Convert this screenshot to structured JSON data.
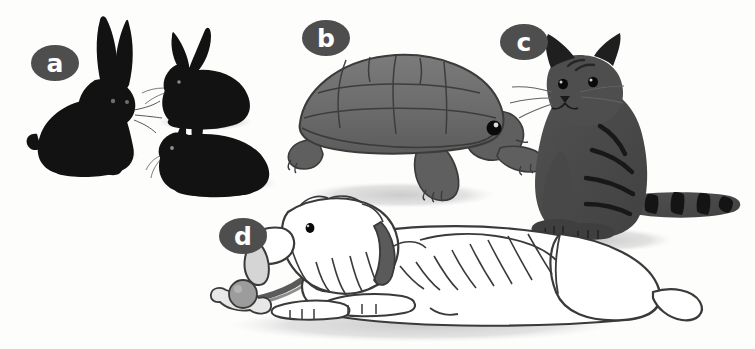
{
  "figure": {
    "background_color": "#fdfdfc",
    "width": 755,
    "height": 349
  },
  "palette": {
    "badge_fill": "#4e4e4e",
    "badge_text": "#ffffff",
    "rabbit_black": "#121212",
    "tortoise_shell": "#6e6e6e",
    "tortoise_shell_dark": "#5a5a5a",
    "tortoise_skin": "#5f5f5f",
    "cat_body": "#4a4a4a",
    "cat_stripe": "#181818",
    "dog_body": "#ffffff",
    "dog_outline": "#3a3a3a",
    "dog_collar": "#5a5a5a",
    "dog_nose": "#9a9a9a",
    "ball_gray": "#9c9c9c",
    "bone_gray": "#d8d8d8",
    "shadow": "#d2d2d2",
    "eye_black": "#050505"
  },
  "labels": [
    {
      "id": "a",
      "text": "a",
      "subject": "rabbits"
    },
    {
      "id": "b",
      "text": "b",
      "subject": "tortoise"
    },
    {
      "id": "c",
      "text": "c",
      "subject": "cat"
    },
    {
      "id": "d",
      "text": "d",
      "subject": "dog"
    }
  ],
  "animals": {
    "group_a": {
      "label": "a",
      "name": "rabbits",
      "count": 3,
      "color": "black",
      "poses": [
        "sitting upright",
        "crouching facing left",
        "crouching facing left low"
      ]
    },
    "group_b": {
      "label": "b",
      "name": "tortoise",
      "count": 1,
      "color": "gray",
      "pose": "walking facing right"
    },
    "group_c": {
      "label": "c",
      "name": "cat",
      "count": 1,
      "color": "dark gray tabby",
      "pose": "sitting facing left with striped tail"
    },
    "group_d": {
      "label": "d",
      "name": "dog",
      "count": 1,
      "color": "white shaggy",
      "pose": "lying down facing left",
      "accessories": [
        "collar",
        "bone",
        "ball"
      ]
    }
  }
}
